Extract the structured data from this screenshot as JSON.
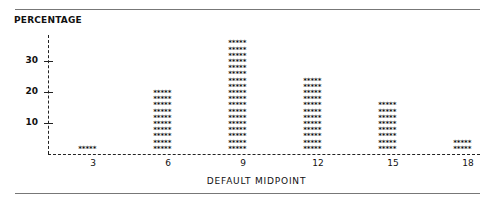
{
  "chart_data": {
    "type": "bar",
    "style": "asterisk-histogram",
    "title": "",
    "xlabel": "DEFAULT MIDPOINT",
    "ylabel": "PERCENTAGE",
    "categories": [
      "3",
      "6",
      "9",
      "12",
      "15",
      "18"
    ],
    "values": [
      2,
      20,
      36,
      24,
      16,
      4
    ],
    "yticks": [
      "10",
      "20",
      "30"
    ],
    "ylim": [
      0,
      38
    ],
    "grid": false,
    "legend": null,
    "bar_glyph": "*****"
  }
}
